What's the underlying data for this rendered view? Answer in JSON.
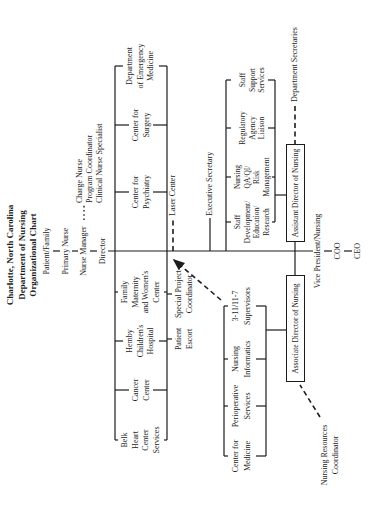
{
  "colors": {
    "ink": "#1c1c1c",
    "paper": "#ffffff"
  },
  "title": {
    "text": "Charlotte, North Carolina\nDepartment of Nursing\nOrganizational Chart"
  },
  "care_chain": {
    "patient_family": "Patient/Family",
    "primary_nurse": "Primary Nurse",
    "nurse_manager": "Nurse Manager",
    "charge_group": "Charge Nurse\nProgram Coordinator\nClinical Nurse Specialist",
    "director": "Director"
  },
  "tier1_departments": {
    "belk": "Belk\nHeart\nCenter\nServices",
    "cancer": "Cancer\nCenter",
    "hemby": "Hemby\nChildren's\nHospital",
    "family": "Family\nMaternity\nand Women's\nCenter",
    "psychiatry": "Center for\nPsychiatry",
    "surgery": "Center for\nSurgery",
    "emergency": "Department\nof Emergency\nMedicine"
  },
  "rail_reports": {
    "patient_escort": "Patient\nEscort",
    "special_project": "Special Project\nCoordinator",
    "laser_center": "Laser Center",
    "executive_secretary": "Executive Secretary"
  },
  "tier2_left": {
    "center_medicine": "Center for\nMedicine",
    "perioperative": "Perioperative\nServices",
    "informatics": "Nursing\nInformatics",
    "supervisors": "3-11/11-7\nSupervisors"
  },
  "tier2_right": {
    "staff_development": "Staff\nDevelopment/\nEducation/\nResearch",
    "nursing_qa": "Nursing\nQA/QI/\nRisk\nManagement",
    "regulatory": "Regulatory\nAgency\nLiaison",
    "staff_support": "Staff\nSupport\nServices"
  },
  "director_boxes": {
    "associate": "Associate Director of Nursing",
    "assistant": "Assistant Director of Nursing"
  },
  "dashed_reports": {
    "nursing_resources": "Nursing Resources\nCoordinator",
    "department_secretaries": "Department Secretaries"
  },
  "executive_chain": {
    "vice_president": "Vice President/Nursing",
    "coo": "COO",
    "ceo": "CEO"
  }
}
